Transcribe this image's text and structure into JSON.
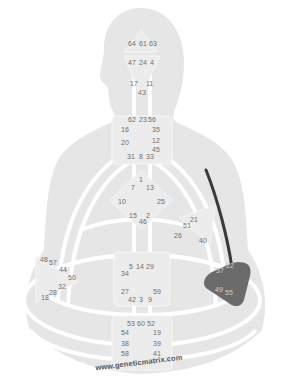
{
  "diagram": {
    "type": "human-design-bodygraph",
    "watermark": "www.geneticmatrix.com",
    "colors": {
      "silhouette": "#e6e6e6",
      "channel_white": "#ffffff",
      "defined_center": "#6b6b6b",
      "defined_channel": "#3a3a3a",
      "gate_text": "#6e6e6e"
    },
    "centers": {
      "head": {
        "gates": [
          "64",
          "61",
          "63"
        ]
      },
      "ajna": {
        "gates": [
          "47",
          "24",
          "4",
          "17",
          "11",
          "43"
        ]
      },
      "throat": {
        "gates": [
          "62",
          "23",
          "56",
          "16",
          "35",
          "20",
          "12",
          "45",
          "31",
          "8",
          "33"
        ]
      },
      "g": {
        "gates": [
          "1",
          "7",
          "13",
          "10",
          "25",
          "15",
          "2",
          "46"
        ]
      },
      "heart": {
        "gates": [
          "21",
          "51",
          "26",
          "40"
        ]
      },
      "spleen": {
        "gates": [
          "48",
          "57",
          "44",
          "50",
          "32",
          "28",
          "18"
        ]
      },
      "sacral": {
        "gates": [
          "5",
          "14",
          "29",
          "34",
          "27",
          "59",
          "42",
          "3",
          "9"
        ]
      },
      "solar_plexus": {
        "gates": [
          "22",
          "37",
          "49",
          "55"
        ],
        "defined": true
      },
      "root": {
        "gates": [
          "53",
          "60",
          "52",
          "54",
          "19",
          "38",
          "39",
          "58",
          "41"
        ]
      }
    },
    "defined_channels": [
      {
        "from": "solar_plexus",
        "to": "shoulder",
        "label": "defined-channel"
      }
    ]
  }
}
